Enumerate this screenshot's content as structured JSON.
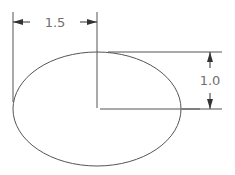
{
  "diagram": {
    "type": "ellipse-dimension-drawing",
    "ellipse": {
      "cx": 97,
      "cy": 109,
      "rx": 84,
      "ry": 57
    },
    "dimensions": {
      "horizontal": {
        "label": "1.5",
        "meaning": "semi-major axis (left edge to center)"
      },
      "vertical": {
        "label": "1.0",
        "meaning": "semi-minor axis (top to center)"
      }
    },
    "colors": {
      "line": "#555555",
      "text": "#707070",
      "background": "#ffffff"
    }
  }
}
